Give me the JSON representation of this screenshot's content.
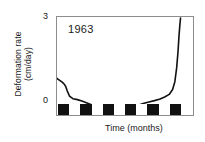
{
  "chart_data": {
    "type": "line",
    "title": "",
    "annotation": "1963",
    "xlabel": "Time  (months)",
    "ylabel_line1": "Deformation rate",
    "ylabel_line2": "(cm/day)",
    "ylabel": "Deformation rate (cm/day)",
    "ylim": [
      0,
      3
    ],
    "ytick_labels": [
      "0",
      "3"
    ],
    "ytick_values": [
      0,
      3
    ],
    "xlim": [
      0,
      6
    ],
    "xtick_labels": [],
    "grid": false,
    "legend": false,
    "line_color": "#111111",
    "frame_color": "#8d8d8d",
    "background": "#ffffff",
    "x": [
      0.0,
      0.1,
      0.2,
      0.3,
      0.38,
      0.45,
      0.55,
      0.7,
      0.9,
      1.1,
      1.35,
      1.6,
      1.85,
      2.05,
      2.25,
      2.45,
      2.6,
      2.75,
      2.9,
      3.1,
      3.3,
      3.55,
      3.8,
      4.05,
      4.3,
      4.55,
      4.75,
      4.95,
      5.1,
      5.2,
      5.28,
      5.34,
      5.38,
      5.42,
      5.45
    ],
    "y": [
      1.12,
      1.07,
      1.02,
      0.96,
      0.88,
      0.74,
      0.58,
      0.5,
      0.47,
      0.43,
      0.36,
      0.29,
      0.23,
      0.19,
      0.16,
      0.15,
      0.17,
      0.21,
      0.22,
      0.22,
      0.24,
      0.29,
      0.35,
      0.4,
      0.44,
      0.49,
      0.55,
      0.63,
      0.78,
      1.02,
      1.45,
      1.95,
      2.4,
      2.75,
      2.97
    ],
    "scalebar": {
      "description": "alternating black/white month blocks along the time axis",
      "segments": [
        "dark",
        "light",
        "dark",
        "light",
        "dark",
        "light",
        "dark",
        "light",
        "dark",
        "light",
        "dark",
        "light"
      ]
    }
  }
}
